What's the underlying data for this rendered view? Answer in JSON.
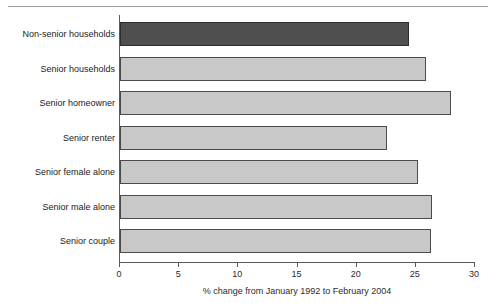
{
  "chart_data": {
    "type": "bar",
    "orientation": "horizontal",
    "title": "",
    "xlabel": "% change from January 1992 to February 2004",
    "ylabel": "",
    "categories": [
      "Non-senior households",
      "Senior households",
      "Senior homeowner",
      "Senior renter",
      "Senior female alone",
      "Senior male alone",
      "Senior couple"
    ],
    "values": [
      24.4,
      25.9,
      28.0,
      22.6,
      25.2,
      26.4,
      26.3
    ],
    "xlim": [
      0,
      30
    ],
    "xticks": [
      0,
      5,
      10,
      15,
      20,
      25,
      30
    ],
    "xtick_labels": [
      "0",
      "5",
      "10",
      "15",
      "20",
      "25",
      "30"
    ],
    "grid": false,
    "legend": "none",
    "bar_colors": [
      "#4f4f4f",
      "#c8c8c8",
      "#c8c8c8",
      "#c8c8c8",
      "#c8c8c8",
      "#c8c8c8",
      "#c8c8c8"
    ]
  },
  "colors": {
    "highlight_bar": "#4f4f4f",
    "default_bar": "#c8c8c8",
    "bar_outline": "#4a4a4a",
    "axis": "#5a5a5a",
    "text": "#1a1a1a",
    "rule": "#9a9a9a",
    "background": "#ffffff"
  }
}
